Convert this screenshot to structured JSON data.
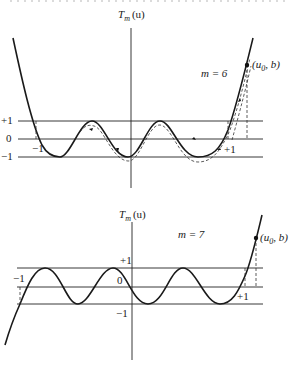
{
  "figure": {
    "top": {
      "axis_label": "T",
      "axis_sub": "m",
      "axis_arg": "(u)",
      "m_label": "m = 6",
      "point_label_open": "(u",
      "point_sub": "0",
      "point_label_close": ", b)",
      "tick_plus1": "+1",
      "tick_zero": "0",
      "tick_minus1": "−1",
      "u_minus1": "−1",
      "u_plus1": "+1"
    },
    "bottom": {
      "axis_label": "T",
      "axis_sub": "m",
      "axis_arg": "(u)",
      "m_label": "m = 7",
      "point_label_open": "(u",
      "point_sub": "0",
      "point_label_close": ", b)",
      "tick_plus1": "+1",
      "tick_zero": "0",
      "tick_minus1": "−1",
      "u_minus1": "−1",
      "u_plus1": "+1"
    }
  }
}
